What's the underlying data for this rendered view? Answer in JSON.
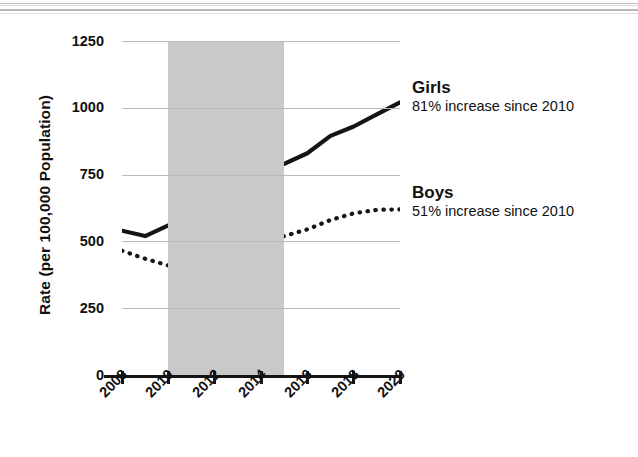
{
  "chart_data": {
    "type": "line",
    "title": "",
    "xlabel": "",
    "ylabel": "Rate (per 100,000 Population)",
    "x": [
      2008,
      2009,
      2010,
      2011,
      2012,
      2013,
      2014,
      2015,
      2016,
      2017,
      2018,
      2019,
      2020
    ],
    "xtick_labels": [
      "2008",
      "2010",
      "2012",
      "2014",
      "2016",
      "2018",
      "2020"
    ],
    "xtick_values": [
      2008,
      2010,
      2012,
      2014,
      2016,
      2018,
      2020
    ],
    "ytick_labels": [
      "0",
      "250",
      "500",
      "750",
      "1000",
      "1250"
    ],
    "ytick_values": [
      0,
      250,
      500,
      750,
      1000,
      1250
    ],
    "xlim": [
      2008,
      2020
    ],
    "ylim": [
      0,
      1250
    ],
    "grid": "horizontal",
    "legend_position": "right-inline-annotations",
    "series": [
      {
        "name": "Girls",
        "style": "solid",
        "color": "#151515",
        "annotation": "81% increase since 2010",
        "values": [
          540,
          520,
          560,
          590,
          655,
          748,
          748,
          790,
          830,
          895,
          930,
          975,
          1020
        ]
      },
      {
        "name": "Boys",
        "style": "dotted",
        "color": "#151515",
        "annotation": "51% increase since 2010",
        "values": [
          465,
          435,
          410,
          440,
          475,
          492,
          498,
          520,
          545,
          580,
          605,
          618,
          620
        ]
      }
    ],
    "shaded_region": {
      "label": "",
      "x_start": 2010,
      "x_end": 2015,
      "color": "#c9c9c9"
    }
  },
  "axis": {
    "y_title": "Rate (per 100,000 Population)",
    "y_ticks": [
      "1250",
      "1000",
      "750",
      "500",
      "250",
      "0"
    ],
    "x_ticks": [
      "2008",
      "2010",
      "2012",
      "2014",
      "2016",
      "2018",
      "2020"
    ]
  },
  "annotations": {
    "girls": {
      "name": "Girls",
      "detail": "81% increase since 2010"
    },
    "boys": {
      "name": "Boys",
      "detail": "51% increase since 2010"
    }
  },
  "colors": {
    "series": "#151515",
    "gridline": "#b9b9b9",
    "shading": "#c9c9c9",
    "background": "#ffffff"
  }
}
